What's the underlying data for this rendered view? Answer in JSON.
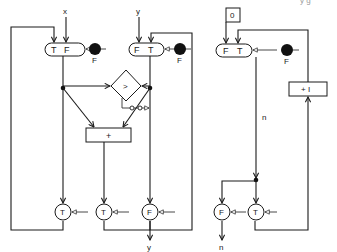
{
  "caption_fragment": "y g",
  "left_system": {
    "inputs": {
      "x": "x",
      "y": "y"
    },
    "merge_left": {
      "left_port": "T",
      "right_port": "F"
    },
    "merge_right": {
      "left_port": "F",
      "right_port": "T"
    },
    "token_left_label": "F",
    "token_right_label": "F",
    "comparator": ">",
    "adder": "+",
    "gates": [
      "T",
      "T",
      "F"
    ],
    "output": "y"
  },
  "right_system": {
    "initial": "0",
    "merge": {
      "left_port": "F",
      "right_port": "T"
    },
    "token_label": "F",
    "increment": "+ I",
    "edge_label": "n",
    "gates": [
      "F",
      "T"
    ],
    "output": "n"
  },
  "colors": {
    "ink": "#1a1a1a",
    "token": "#111111",
    "background": "#ffffff"
  }
}
